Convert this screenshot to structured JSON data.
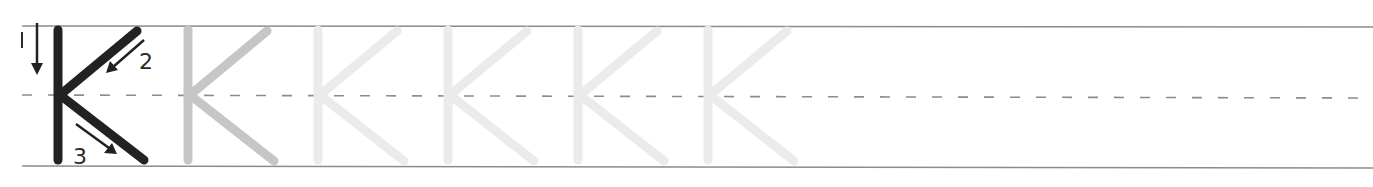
{
  "worksheet": {
    "letter": "K",
    "stroke_numbers": [
      "1",
      "2",
      "3"
    ],
    "model_color": "#222222",
    "trace_colors": [
      "#c6c6c6",
      "#ebebeb",
      "#ebebeb",
      "#ebebeb",
      "#ebebeb"
    ],
    "guide_line_color": "#8c8c8c",
    "dash_color": "#8c8c8c",
    "trace_count": 5
  }
}
